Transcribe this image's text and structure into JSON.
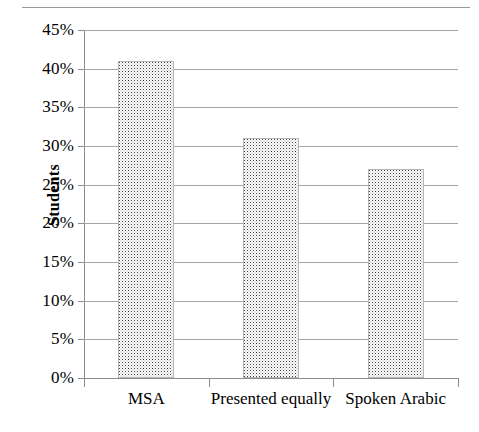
{
  "chart_data": {
    "type": "bar",
    "title": "",
    "xlabel": "",
    "ylabel": "Students",
    "categories": [
      "MSA",
      "Presented equally",
      "Spoken Arabic"
    ],
    "values": [
      41,
      31,
      27
    ],
    "value_labels": [
      "41%",
      "31%",
      "27%"
    ],
    "ylim": [
      0,
      45
    ],
    "ytick_values": [
      0,
      5,
      10,
      15,
      20,
      25,
      30,
      35,
      40,
      45
    ],
    "ytick_labels": [
      "0%",
      "5%",
      "10%",
      "15%",
      "20%",
      "25%",
      "30%",
      "35%",
      "40%",
      "45%"
    ],
    "grid": true,
    "legend": "none",
    "series": [
      {
        "name": "Students",
        "values": [
          41,
          31,
          27
        ]
      }
    ],
    "bar_fill": "fine gray dot pattern",
    "bar_border_color": "#b5b5b5",
    "gridline_color": "#a6a6a6",
    "axis_color": "#8c8c8c",
    "background": "#ffffff"
  },
  "ticks": {
    "y": [
      {
        "label": "45%",
        "value": 45
      },
      {
        "label": "40%",
        "value": 40
      },
      {
        "label": "35%",
        "value": 35
      },
      {
        "label": "30%",
        "value": 30
      },
      {
        "label": "25%",
        "value": 25
      },
      {
        "label": "20%",
        "value": 20
      },
      {
        "label": "15%",
        "value": 15
      },
      {
        "label": "10%",
        "value": 10
      },
      {
        "label": "5%",
        "value": 5
      },
      {
        "label": "0%",
        "value": 0
      }
    ]
  },
  "axis_titles": {
    "y": "Students"
  },
  "categories": [
    {
      "label": "MSA"
    },
    {
      "label": "Presented equally"
    },
    {
      "label": "Spoken Arabic"
    }
  ]
}
